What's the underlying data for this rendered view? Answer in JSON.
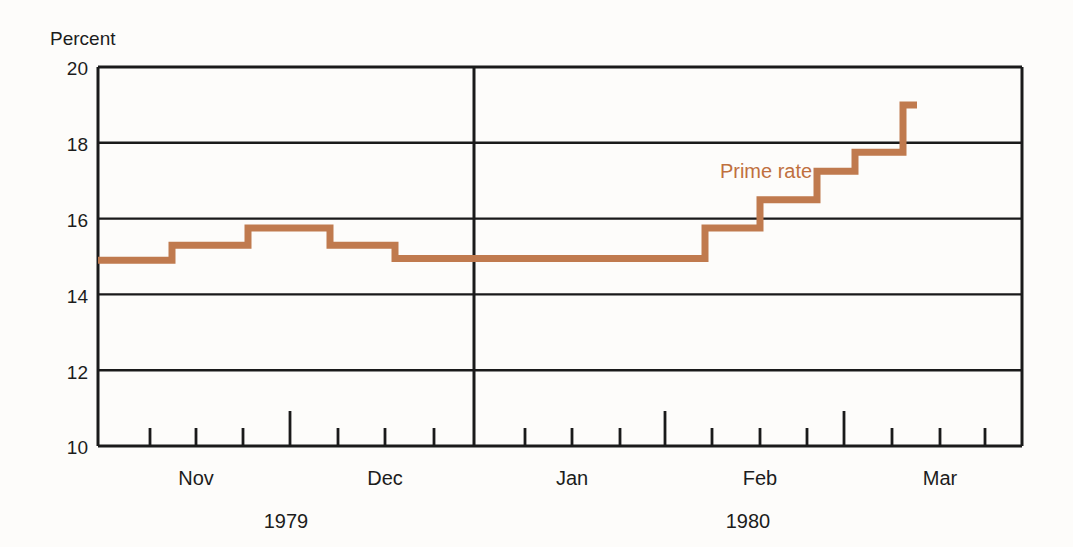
{
  "chart_data": {
    "type": "line",
    "title": "",
    "subtitle": "",
    "ylabel": "Percent",
    "xlabel": "",
    "ylim": [
      10,
      20
    ],
    "yticks": [
      10,
      12,
      14,
      16,
      18,
      20
    ],
    "ytick_labels": [
      "10",
      "12",
      "14",
      "16",
      "18",
      "20"
    ],
    "grid": true,
    "legend_position": "inline-annotation",
    "annotations": [
      {
        "text": "Prime rate",
        "x_px": 766,
        "y_px": 178,
        "color": "#c0703e"
      }
    ],
    "month_labels": [
      "Nov",
      "Dec",
      "Jan",
      "Feb",
      "Mar"
    ],
    "year_labels": [
      "1979",
      "1980"
    ],
    "series": [
      {
        "name": "Prime rate",
        "color": "#c07a4e",
        "step": "post",
        "points": [
          {
            "x_px": 98,
            "value": 14.9
          },
          {
            "x_px": 172,
            "value": 15.3
          },
          {
            "x_px": 248,
            "value": 15.75
          },
          {
            "x_px": 330,
            "value": 15.3
          },
          {
            "x_px": 395,
            "value": 14.95
          },
          {
            "x_px": 705,
            "value": 15.75
          },
          {
            "x_px": 760,
            "value": 16.5
          },
          {
            "x_px": 817,
            "value": 17.25
          },
          {
            "x_px": 855,
            "value": 17.75
          },
          {
            "x_px": 903,
            "value": 19.0
          },
          {
            "x_px": 917,
            "value": 19.0
          }
        ]
      }
    ]
  },
  "axis": {
    "unit_caption": "Percent",
    "y_tick_values": [
      "20",
      "18",
      "16",
      "14",
      "12",
      "10"
    ],
    "months": [
      {
        "label": "Nov",
        "x_px": 196
      },
      {
        "label": "Dec",
        "x_px": 385
      },
      {
        "label": "Jan",
        "x_px": 572
      },
      {
        "label": "Feb",
        "x_px": 760
      },
      {
        "label": "Mar",
        "x_px": 940
      }
    ],
    "years": [
      {
        "label": "1979",
        "x_px": 286
      },
      {
        "label": "1980",
        "x_px": 748
      }
    ],
    "tick_marks_px": [
      150,
      196,
      243,
      290,
      338,
      385,
      434,
      474,
      525,
      572,
      620,
      665,
      712,
      760,
      807,
      844,
      892,
      940,
      985
    ],
    "tall_tick_marks_px": [
      290,
      474,
      665,
      844
    ]
  },
  "colors": {
    "series": "#c07a4e",
    "annotation": "#c0703e",
    "frame": "#1a1a1a",
    "background": "#fdfcfa"
  }
}
